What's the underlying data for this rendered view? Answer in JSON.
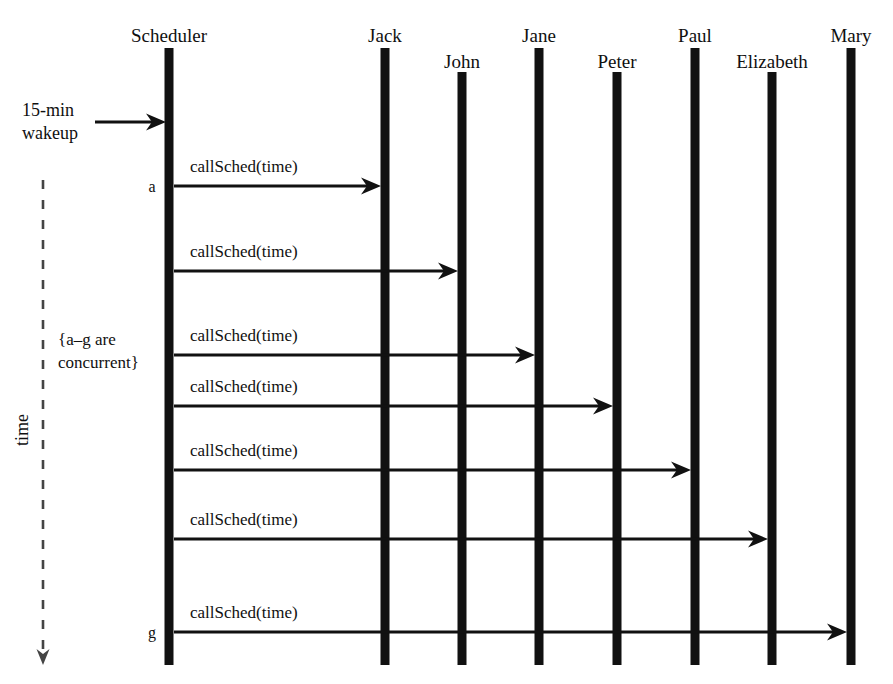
{
  "diagram": {
    "type": "uml-sequence-diagram",
    "width": 893,
    "height": 684,
    "background_color": "#ffffff",
    "line_color": "#111111",
    "text_color": "#101010"
  },
  "lifelines": [
    {
      "name": "Scheduler",
      "x": 169,
      "bar_width": 9,
      "bar_top": 48,
      "bar_bottom": 665
    },
    {
      "name": "Jack",
      "x": 385,
      "bar_width": 9,
      "bar_top": 48,
      "bar_bottom": 665
    },
    {
      "name": "John",
      "x": 462,
      "bar_width": 9,
      "bar_top": 72,
      "bar_bottom": 665
    },
    {
      "name": "Jane",
      "x": 539,
      "bar_width": 9,
      "bar_top": 48,
      "bar_bottom": 665
    },
    {
      "name": "Peter",
      "x": 617,
      "bar_width": 9,
      "bar_top": 72,
      "bar_bottom": 665
    },
    {
      "name": "Paul",
      "x": 695,
      "bar_width": 9,
      "bar_top": 48,
      "bar_bottom": 665
    },
    {
      "name": "Elizabeth",
      "x": 772,
      "bar_width": 9,
      "bar_top": 72,
      "bar_bottom": 665
    },
    {
      "name": "Mary",
      "x": 851,
      "bar_width": 9,
      "bar_top": 48,
      "bar_bottom": 665
    }
  ],
  "lifeline_labels": [
    {
      "text": "Scheduler",
      "x": 169,
      "y": 42
    },
    {
      "text": "Jack",
      "x": 385,
      "y": 42
    },
    {
      "text": "John",
      "x": 462,
      "y": 68
    },
    {
      "text": "Jane",
      "x": 539,
      "y": 42
    },
    {
      "text": "Peter",
      "x": 617,
      "y": 68
    },
    {
      "text": "Paul",
      "x": 695,
      "y": 42
    },
    {
      "text": "Elizabeth",
      "x": 772,
      "y": 68
    },
    {
      "text": "Mary",
      "x": 851,
      "y": 42
    }
  ],
  "external_event": {
    "label_line1": "15-min",
    "label_line2": "wakeup",
    "label_x": 22,
    "label_y1": 116,
    "label_y2": 139,
    "arrow_from_x": 95,
    "arrow_to_x": 166,
    "arrow_y": 122
  },
  "messages": [
    {
      "id": "a",
      "label": "callSched(time)",
      "from": "Scheduler",
      "to": "Jack",
      "from_x": 174,
      "to_x": 381,
      "y": 186,
      "label_x": 190,
      "label_y": 172
    },
    {
      "id": "b",
      "label": "callSched(time)",
      "from": "Scheduler",
      "to": "John",
      "from_x": 174,
      "to_x": 458,
      "y": 271,
      "label_x": 190,
      "label_y": 257
    },
    {
      "id": "c",
      "label": "callSched(time)",
      "from": "Scheduler",
      "to": "Jane",
      "from_x": 174,
      "to_x": 535,
      "y": 355,
      "label_x": 190,
      "label_y": 341
    },
    {
      "id": "d",
      "label": "callSched(time)",
      "from": "Scheduler",
      "to": "Peter",
      "from_x": 174,
      "to_x": 613,
      "y": 406,
      "label_x": 190,
      "label_y": 392
    },
    {
      "id": "e",
      "label": "callSched(time)",
      "from": "Scheduler",
      "to": "Paul",
      "from_x": 174,
      "to_x": 691,
      "y": 470,
      "label_x": 190,
      "label_y": 456
    },
    {
      "id": "f",
      "label": "callSched(time)",
      "from": "Scheduler",
      "to": "Elizabeth",
      "from_x": 174,
      "to_x": 768,
      "y": 539,
      "label_x": 190,
      "label_y": 525
    },
    {
      "id": "g",
      "label": "callSched(time)",
      "from": "Scheduler",
      "to": "Mary",
      "from_x": 174,
      "to_x": 847,
      "y": 632,
      "label_x": 190,
      "label_y": 618
    }
  ],
  "message_markers": [
    {
      "text": "a",
      "x": 152,
      "y": 192
    },
    {
      "text": "g",
      "x": 152,
      "y": 638
    }
  ],
  "note": {
    "line1": "{a–g are",
    "line2": "concurrent}",
    "x": 58,
    "y1": 345,
    "y2": 368
  },
  "time_axis": {
    "label": "time",
    "label_x": 28,
    "label_y": 430,
    "line_x": 43,
    "line_top": 180,
    "line_bottom": 650,
    "arrow_tip_y": 665
  }
}
